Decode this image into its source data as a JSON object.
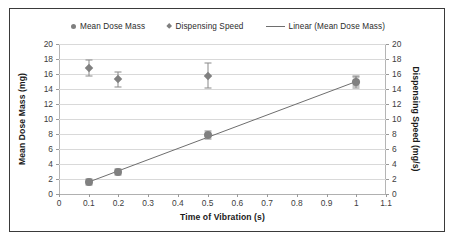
{
  "chart_data": {
    "type": "scatter",
    "title": "",
    "xlabel": "Time of Vibration (s)",
    "ylabel": "Mean Dose Mass (mg)",
    "ylabel_secondary": "Dispensing Speed (mg/s)",
    "xlim": [
      0,
      1.1
    ],
    "ylim": [
      0,
      20
    ],
    "ylim_secondary": [
      0,
      20
    ],
    "grid": true,
    "legend_position": "top",
    "xticks": [
      "0",
      "0.1",
      "0.2",
      "0.3",
      "0.4",
      "0.5",
      "0.6",
      "0.7",
      "0.8",
      "0.9",
      "1",
      "1.1"
    ],
    "xtick_values": [
      0,
      0.1,
      0.2,
      0.3,
      0.4,
      0.5,
      0.6,
      0.7,
      0.8,
      0.9,
      1.0,
      1.1
    ],
    "yticks": [
      "0",
      "2",
      "4",
      "6",
      "8",
      "10",
      "12",
      "14",
      "16",
      "18",
      "20"
    ],
    "ytick_values": [
      0,
      2,
      4,
      6,
      8,
      10,
      12,
      14,
      16,
      18,
      20
    ],
    "yticks_secondary": [
      "0",
      "2",
      "4",
      "6",
      "8",
      "10",
      "12",
      "14",
      "16",
      "18",
      "20"
    ],
    "ytick_values_secondary": [
      0,
      2,
      4,
      6,
      8,
      10,
      12,
      14,
      16,
      18,
      20
    ],
    "x": [
      0.1,
      0.2,
      0.5,
      1.0
    ],
    "series": [
      {
        "name": "Mean Dose Mass",
        "axis": "left",
        "marker": "circle",
        "color": "#808080",
        "values": [
          1.6,
          3.0,
          7.9,
          15.0
        ],
        "error": [
          0.4,
          0.4,
          0.5,
          0.6
        ]
      },
      {
        "name": "Dispensing Speed",
        "axis": "right",
        "marker": "diamond",
        "color": "#808080",
        "values": [
          16.8,
          15.3,
          15.8,
          15.0
        ],
        "error": [
          1.1,
          1.0,
          1.7,
          0.8
        ]
      }
    ],
    "trendline": {
      "name": "Linear (Mean Dose Mass)",
      "color": "#6e6e6e",
      "x": [
        0.1,
        1.0
      ],
      "y": [
        1.6,
        15.0
      ]
    }
  },
  "legend": {
    "items": [
      {
        "label": "Mean Dose Mass",
        "marker": "circle"
      },
      {
        "label": "Dispensing Speed",
        "marker": "diamond"
      },
      {
        "label": "Linear (Mean Dose Mass)",
        "marker": "line"
      }
    ]
  },
  "colors": {
    "marker": "#808080",
    "trendline": "#6e6e6e",
    "gridline": "#d9d9d9",
    "frame": "#3a3a3a",
    "text": "#1a1a1a"
  }
}
